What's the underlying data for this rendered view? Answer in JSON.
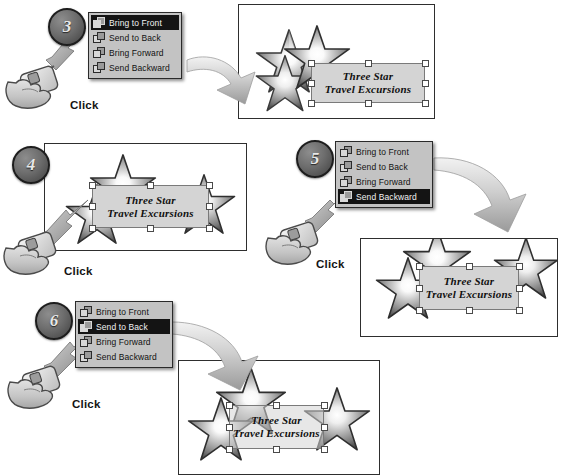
{
  "document": {
    "title": "Order Objects Tutorial",
    "background_color": "#ffffff",
    "accent_color": "#6e6e6e"
  },
  "menu_items": [
    {
      "label": "Bring to Front",
      "icon": "bring-to-front-icon"
    },
    {
      "label": "Send to Back",
      "icon": "send-to-back-icon"
    },
    {
      "label": "Bring Forward",
      "icon": "bring-forward-icon"
    },
    {
      "label": "Send Backward",
      "icon": "send-backward-icon"
    }
  ],
  "artwork": {
    "text_line1": "Three Star",
    "text_line2": "Travel Excursions"
  },
  "labels": {
    "click": "Click"
  },
  "steps": [
    {
      "number": "3",
      "selected_menu_item": "Bring to Front",
      "selected_index": 0,
      "click_label": "Click",
      "menu_items": [
        "Bring to Front",
        "Send to Back",
        "Bring Forward",
        "Send Backward"
      ]
    },
    {
      "number": "4",
      "selected_menu_item": "",
      "selected_index": -1,
      "click_label": "Click",
      "menu_items": []
    },
    {
      "number": "5",
      "selected_menu_item": "Send Backward",
      "selected_index": 3,
      "click_label": "Click",
      "menu_items": [
        "Bring to Front",
        "Send to Back",
        "Bring Forward",
        "Send Backward"
      ]
    },
    {
      "number": "6",
      "selected_menu_item": "Send to Back",
      "selected_index": 1,
      "click_label": "Click",
      "menu_items": [
        "Bring to Front",
        "Send to Back",
        "Bring Forward",
        "Send Backward"
      ]
    }
  ]
}
